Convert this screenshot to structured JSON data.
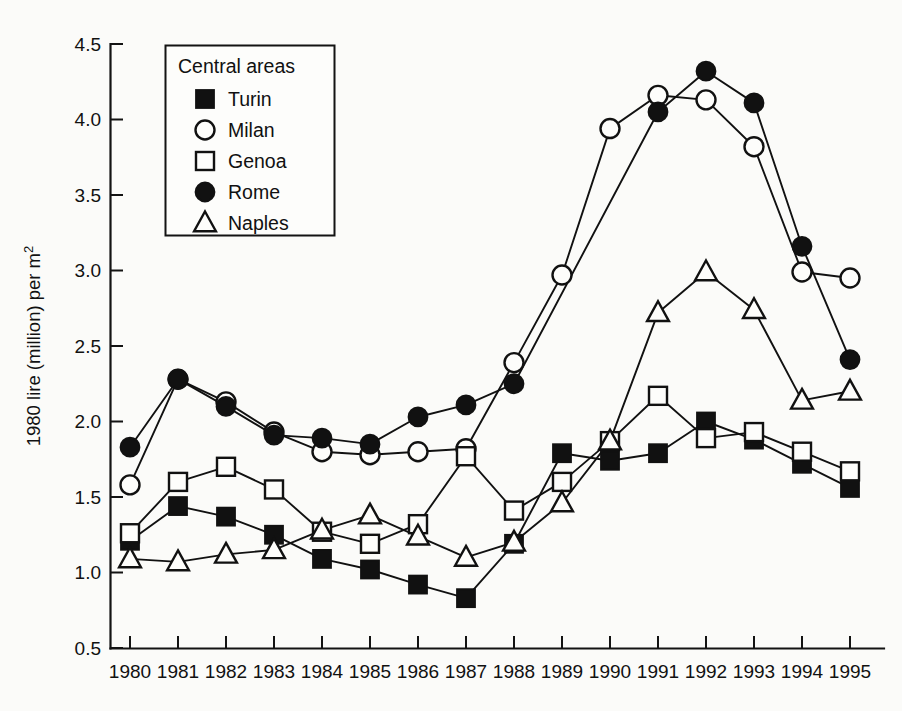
{
  "chart_data": {
    "type": "line",
    "title": "",
    "xlabel": "",
    "ylabel": "1980 lire (million) per m",
    "ylabel_superscript": "2",
    "ylabel_full": "1980 lire (million) per m2",
    "legend_title": "Central areas",
    "legend_position": "top-left inside",
    "grid": false,
    "xlim": [
      1980,
      1995
    ],
    "ylim": [
      0.5,
      4.5
    ],
    "ytick_labels": [
      "4.5",
      "4.0",
      "3.5",
      "3.0",
      "2.5",
      "2.0",
      "1.5",
      "1.0",
      "0.5"
    ],
    "ytick_values": [
      4.5,
      4.0,
      3.5,
      3.0,
      2.5,
      2.0,
      1.5,
      1.0,
      0.5
    ],
    "categories": [
      1980,
      1981,
      1982,
      1983,
      1984,
      1985,
      1986,
      1987,
      1988,
      1989,
      1990,
      1991,
      1992,
      1993,
      1994,
      1995
    ],
    "xtick_labels": [
      "1980",
      "1981",
      "1982",
      "1983",
      "1984",
      "1985",
      "1986",
      "1987",
      "1988",
      "1989",
      "1990",
      "1991",
      "1992",
      "1993",
      "1994",
      "1995"
    ],
    "series": [
      {
        "name": "Turin",
        "marker": "filled-square",
        "values": [
          1.21,
          1.44,
          1.37,
          1.25,
          1.09,
          1.02,
          0.92,
          0.83,
          1.19,
          1.79,
          1.74,
          1.79,
          2.0,
          1.88,
          1.72,
          1.56
        ]
      },
      {
        "name": "Milan",
        "marker": "open-circle",
        "values": [
          1.58,
          2.28,
          2.13,
          1.93,
          1.8,
          1.78,
          1.8,
          1.82,
          2.39,
          2.97,
          3.94,
          4.16,
          4.13,
          3.82,
          2.99,
          2.95
        ]
      },
      {
        "name": "Genoa",
        "marker": "open-square",
        "values": [
          1.26,
          1.6,
          1.7,
          1.55,
          1.27,
          1.19,
          1.32,
          1.77,
          1.41,
          1.6,
          1.87,
          2.17,
          1.89,
          1.93,
          1.8,
          1.67
        ]
      },
      {
        "name": "Rome",
        "marker": "filled-circle",
        "values": [
          1.83,
          2.28,
          2.1,
          1.91,
          1.89,
          1.85,
          2.03,
          2.11,
          2.25,
          null,
          null,
          4.05,
          4.32,
          4.11,
          3.16,
          2.41
        ]
      },
      {
        "name": "Naples",
        "marker": "open-triangle",
        "values": [
          1.09,
          1.07,
          1.12,
          1.15,
          1.28,
          1.38,
          1.24,
          1.1,
          1.2,
          1.46,
          1.87,
          2.72,
          2.99,
          2.74,
          2.14,
          2.2
        ]
      }
    ]
  },
  "legend": {
    "title": "Central areas",
    "entries": [
      {
        "label": "Turin",
        "marker": "filled-square"
      },
      {
        "label": "Milan",
        "marker": "open-circle"
      },
      {
        "label": "Genoa",
        "marker": "open-square"
      },
      {
        "label": "Rome",
        "marker": "filled-circle"
      },
      {
        "label": "Naples",
        "marker": "open-triangle"
      }
    ]
  },
  "colors": {
    "ink": "#111111",
    "background": "#fbfbf9",
    "marker_fill_open": "#fdfdfb"
  }
}
